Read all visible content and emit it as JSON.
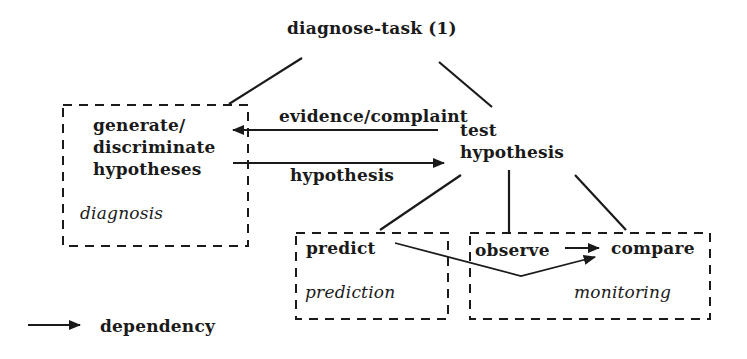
{
  "root": {
    "label": "diagnose-task (1)"
  },
  "groups": {
    "diagnosis": {
      "label": "diagnosis",
      "task_lines": [
        "generate/",
        "discriminate",
        "hypotheses"
      ]
    },
    "prediction": {
      "label": "prediction",
      "task": "predict"
    },
    "monitoring": {
      "label": "monitoring",
      "tasks": [
        "observe",
        "compare"
      ]
    }
  },
  "nodes": {
    "test_hypothesis": {
      "lines": [
        "test",
        "hypothesis"
      ]
    }
  },
  "edges": {
    "evidence_label": "evidence/complaint",
    "hypothesis_label": "hypothesis"
  },
  "legend": {
    "arrow_meaning": "dependency"
  },
  "colors": {
    "ink": "#1a1a1a",
    "background": "#ffffff"
  }
}
